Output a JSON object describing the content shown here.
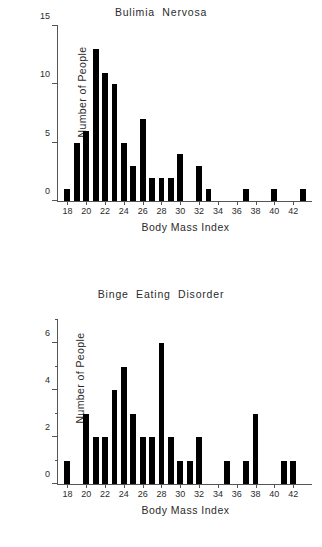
{
  "figure": {
    "background": "#ffffff",
    "bar_color": "#000000",
    "axis_color": "#555555"
  },
  "charts": [
    {
      "id": "bulimia",
      "title": "Bulimia  Nervosa",
      "xlabel": "Body Mass Index",
      "ylabel": "Number of People"
    },
    {
      "id": "binge",
      "title": "Binge  Eating  Disorder",
      "xlabel": "Body Mass Index",
      "ylabel": "Number of People"
    }
  ],
  "caption": "",
  "chart_data": [
    {
      "type": "bar",
      "title": "Bulimia  Nervosa",
      "xlabel": "Body Mass Index",
      "ylabel": "Number of People",
      "xlim": [
        17.0,
        44.0
      ],
      "ylim": [
        0,
        15
      ],
      "yticks": [
        0,
        5,
        10,
        15
      ],
      "ytick_labels": [
        "0",
        "5",
        "10",
        "15"
      ],
      "y_minor_ticks": [],
      "xticks": [
        18,
        20,
        22,
        24,
        26,
        28,
        30,
        32,
        34,
        36,
        38,
        40,
        42
      ],
      "xtick_labels": [
        "18",
        "20",
        "22",
        "24",
        "26",
        "28",
        "30",
        "32",
        "34",
        "36",
        "38",
        "40",
        "42"
      ],
      "grid": false,
      "legend": "none",
      "bar_width": 1,
      "categories": [
        18,
        19,
        20,
        21,
        22,
        23,
        24,
        25,
        26,
        27,
        28,
        29,
        30,
        31,
        32,
        33,
        34,
        35,
        36,
        37,
        38,
        39,
        40,
        41,
        42,
        43
      ],
      "values": [
        1,
        5,
        6,
        13,
        11,
        10,
        5,
        3,
        7,
        2,
        2,
        2,
        4,
        0,
        3,
        1,
        0,
        0,
        0,
        1,
        0,
        0,
        1,
        0,
        0,
        1
      ]
    },
    {
      "type": "bar",
      "title": "Binge  Eating  Disorder",
      "xlabel": "Body Mass Index",
      "ylabel": "Number of People",
      "xlim": [
        17.0,
        44.0
      ],
      "ylim": [
        0,
        7
      ],
      "yticks": [
        0,
        2,
        4,
        6
      ],
      "ytick_labels": [
        "0",
        "2",
        "4",
        "6"
      ],
      "y_minor_ticks": [
        1,
        3,
        5,
        7
      ],
      "xticks": [
        18,
        20,
        22,
        24,
        26,
        28,
        30,
        32,
        34,
        36,
        38,
        40,
        42
      ],
      "xtick_labels": [
        "18",
        "20",
        "22",
        "24",
        "26",
        "28",
        "30",
        "32",
        "34",
        "36",
        "38",
        "40",
        "42"
      ],
      "grid": false,
      "legend": "none",
      "bar_width": 1,
      "categories": [
        18,
        19,
        20,
        21,
        22,
        23,
        24,
        25,
        26,
        27,
        28,
        29,
        30,
        31,
        32,
        33,
        34,
        35,
        36,
        37,
        38,
        39,
        40,
        41,
        42
      ],
      "values": [
        1,
        0,
        3,
        2,
        2,
        4,
        5,
        3,
        2,
        2,
        6,
        2,
        1,
        1,
        2,
        0,
        0,
        1,
        0,
        1,
        3,
        0,
        0,
        1,
        1
      ]
    }
  ]
}
